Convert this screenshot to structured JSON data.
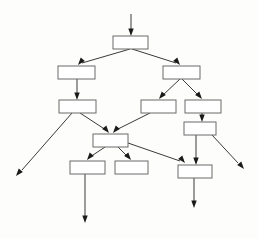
{
  "diagram": {
    "canvas": {
      "width": 258,
      "height": 239,
      "background": "#fdfdfb"
    },
    "style": {
      "box_fill": "#ffffff",
      "box_stroke": "#6b6b6b",
      "edge_color": "#3a3a3a",
      "arrowhead_color": "#1a1a1a"
    },
    "nodes": [
      {
        "id": "n1",
        "label": "",
        "x": 113,
        "y": 36,
        "w": 35,
        "h": 13,
        "row": 1
      },
      {
        "id": "n2",
        "label": "",
        "x": 58,
        "y": 66,
        "w": 37,
        "h": 13,
        "row": 2
      },
      {
        "id": "n3",
        "label": "",
        "x": 163,
        "y": 66,
        "w": 37,
        "h": 13,
        "row": 2
      },
      {
        "id": "n4",
        "label": "",
        "x": 59,
        "y": 100,
        "w": 37,
        "h": 13,
        "row": 3
      },
      {
        "id": "n5",
        "label": "",
        "x": 141,
        "y": 100,
        "w": 35,
        "h": 13,
        "row": 3
      },
      {
        "id": "n6",
        "label": "",
        "x": 185,
        "y": 100,
        "w": 36,
        "h": 13,
        "row": 3
      },
      {
        "id": "n7",
        "label": "",
        "x": 184,
        "y": 122,
        "w": 32,
        "h": 13,
        "row": 4
      },
      {
        "id": "n8",
        "label": "",
        "x": 93,
        "y": 134,
        "w": 35,
        "h": 13,
        "row": 4
      },
      {
        "id": "n9",
        "label": "",
        "x": 70,
        "y": 161,
        "w": 35,
        "h": 13,
        "row": 5
      },
      {
        "id": "n10",
        "label": "",
        "x": 115,
        "y": 161,
        "w": 33,
        "h": 13,
        "row": 5
      },
      {
        "id": "n11",
        "label": "",
        "x": 178,
        "y": 165,
        "w": 34,
        "h": 13,
        "row": 5
      }
    ],
    "edges": [
      {
        "id": "e0",
        "from": "input",
        "to": "n1",
        "points": "131,14 131,32",
        "head": {
          "x": 131,
          "y": 36,
          "dir": "down"
        }
      },
      {
        "id": "e1",
        "from": "n1",
        "to": "n2",
        "points": "130,49 82,63",
        "head": {
          "x": 78,
          "y": 65,
          "dir": "downleft"
        }
      },
      {
        "id": "e2",
        "from": "n1",
        "to": "n3",
        "points": "132,49 176,63",
        "head": {
          "x": 180,
          "y": 65,
          "dir": "downright"
        }
      },
      {
        "id": "e3",
        "from": "n2",
        "to": "n4",
        "points": "77,79 77,96",
        "head": {
          "x": 77,
          "y": 100,
          "dir": "down"
        }
      },
      {
        "id": "e4",
        "from": "n3",
        "to": "n5",
        "points": "180,79 162,96",
        "head": {
          "x": 159,
          "y": 99,
          "dir": "downleft"
        }
      },
      {
        "id": "e5",
        "from": "n3",
        "to": "n6",
        "points": "182,79 199,96",
        "head": {
          "x": 202,
          "y": 99,
          "dir": "downright"
        }
      },
      {
        "id": "e6",
        "from": "n6",
        "to": "n7",
        "points": "202,113 202,118",
        "head": {
          "x": 202,
          "y": 122,
          "dir": "down"
        }
      },
      {
        "id": "e7",
        "from": "n4",
        "to": "exit-left",
        "points": "72,113 22,170",
        "head": {
          "x": 16,
          "y": 176,
          "dir": "downleft"
        }
      },
      {
        "id": "e8",
        "from": "n4",
        "to": "n8",
        "points": "80,113 106,130",
        "head": {
          "x": 109,
          "y": 133,
          "dir": "downright"
        }
      },
      {
        "id": "e9",
        "from": "n5",
        "to": "n8",
        "points": "150,113 116,130",
        "head": {
          "x": 113,
          "y": 133,
          "dir": "downleft"
        }
      },
      {
        "id": "e10",
        "from": "n7",
        "to": "exit-right",
        "points": "212,135 238,163",
        "head": {
          "x": 244,
          "y": 169,
          "dir": "downright"
        }
      },
      {
        "id": "e11",
        "from": "n7",
        "to": "n11",
        "points": "196,135 196,161",
        "head": {
          "x": 196,
          "y": 165,
          "dir": "down"
        }
      },
      {
        "id": "e12",
        "from": "n8",
        "to": "n9",
        "points": "105,147 90,157",
        "head": {
          "x": 87,
          "y": 160,
          "dir": "downleft"
        }
      },
      {
        "id": "e13",
        "from": "n8",
        "to": "n10",
        "points": "118,147 128,157",
        "head": {
          "x": 131,
          "y": 160,
          "dir": "downright"
        }
      },
      {
        "id": "e14",
        "from": "n8",
        "to": "n11",
        "points": "128,143 180,161",
        "head": {
          "x": 185,
          "y": 163,
          "dir": "downright"
        }
      },
      {
        "id": "e15",
        "from": "n9",
        "to": "exit-bottom-left",
        "points": "85,174 85,218",
        "head": {
          "x": 85,
          "y": 223,
          "dir": "down"
        }
      },
      {
        "id": "e16",
        "from": "n11",
        "to": "exit-bottom-right",
        "points": "194,178 194,203",
        "head": {
          "x": 194,
          "y": 208,
          "dir": "down"
        }
      }
    ]
  }
}
